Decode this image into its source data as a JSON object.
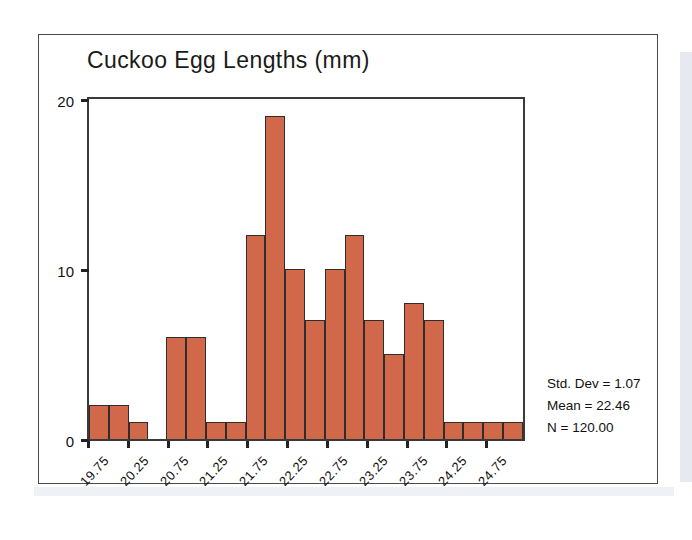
{
  "chart_data": {
    "type": "bar",
    "title": "Cuckoo Egg Lengths (mm)",
    "xlabel": "",
    "ylabel": "",
    "ylim": [
      0,
      20
    ],
    "yticks": [
      0,
      10,
      20
    ],
    "ytick_labels": [
      "0",
      "10",
      "20"
    ],
    "grid": false,
    "legend": null,
    "bin_width": 0.25,
    "categories": [
      "19.75",
      "20.00",
      "20.25",
      "20.50",
      "20.75",
      "21.00",
      "21.25",
      "21.50",
      "21.75",
      "22.00",
      "22.25",
      "22.50",
      "22.75",
      "23.00",
      "23.25",
      "23.50",
      "23.75",
      "24.00",
      "24.25",
      "24.50",
      "24.75",
      "25.00"
    ],
    "values": [
      2,
      2,
      1,
      0,
      6,
      6,
      1,
      1,
      12,
      19,
      10,
      7,
      10,
      12,
      7,
      5,
      8,
      7,
      1,
      1,
      1,
      1
    ],
    "xtick_labels": [
      "19.75",
      "20.25",
      "20.75",
      "21.25",
      "21.75",
      "22.25",
      "22.75",
      "23.25",
      "23.75",
      "24.25",
      "24.75"
    ],
    "bar_color": "#d2684a",
    "bar_edge_color": "#2e2e2e",
    "axis_color": "#3a3a3a"
  },
  "annotations": {
    "std_dev": "Std. Dev = 1.07",
    "mean": "Mean = 22.46",
    "n": "N = 120.00"
  }
}
